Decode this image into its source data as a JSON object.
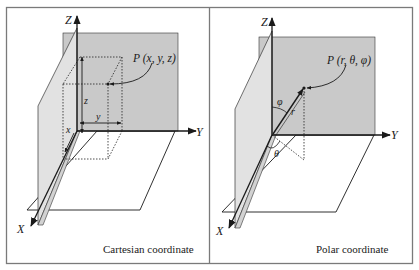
{
  "figure": {
    "panels": [
      {
        "id": "cartesian",
        "caption": "Cartesian coordinate",
        "axes": {
          "z": "Z",
          "y": "Y",
          "x": "X"
        },
        "point_label": "P (x, y, z)",
        "component_labels": {
          "z": "z",
          "y": "y",
          "x": "x"
        }
      },
      {
        "id": "polar",
        "caption": "Polar coordinate",
        "axes": {
          "z": "Z",
          "y": "Y",
          "x": "X"
        },
        "point_label": "P (r, θ, φ)",
        "component_labels": {
          "r": "r",
          "theta": "θ",
          "phi": "φ"
        }
      }
    ],
    "colors": {
      "border": "#7a7a7a",
      "plane_yz": "#c9c9c9",
      "plane_xz": "#e2e2e2",
      "ink": "#1a1a1a"
    }
  }
}
